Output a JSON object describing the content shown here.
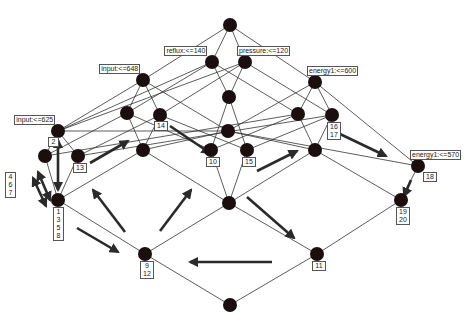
{
  "diagram": {
    "type": "concept-lattice",
    "nodes": [
      {
        "id": "top",
        "x": 230,
        "y": 25
      },
      {
        "id": "reflux",
        "x": 212,
        "y": 62,
        "label": "reflux:<=140"
      },
      {
        "id": "pressure",
        "x": 245,
        "y": 62,
        "label": "pressure:<=120"
      },
      {
        "id": "input648",
        "x": 143,
        "y": 80,
        "label": "input:<=648"
      },
      {
        "id": "energy600",
        "x": 315,
        "y": 82,
        "label": "energy1:<=600"
      },
      {
        "id": "n_a",
        "x": 127,
        "y": 113
      },
      {
        "id": "n_14",
        "x": 160,
        "y": 115,
        "nums": [
          "14"
        ]
      },
      {
        "id": "n_c",
        "x": 229,
        "y": 97
      },
      {
        "id": "n_d",
        "x": 298,
        "y": 114
      },
      {
        "id": "n_1617",
        "x": 332,
        "y": 115,
        "nums": [
          "16",
          "17"
        ]
      },
      {
        "id": "input625",
        "x": 58,
        "y": 131,
        "label": "input:<=625",
        "nums": [
          "2"
        ]
      },
      {
        "id": "n_e",
        "x": 228,
        "y": 131
      },
      {
        "id": "n_f",
        "x": 143,
        "y": 150
      },
      {
        "id": "n_g",
        "x": 315,
        "y": 150
      },
      {
        "id": "n_467",
        "x": 45,
        "y": 156
      },
      {
        "id": "n_13",
        "x": 78,
        "y": 156,
        "nums": [
          "13"
        ]
      },
      {
        "id": "n_10",
        "x": 211,
        "y": 150,
        "nums": [
          "10"
        ]
      },
      {
        "id": "n_15",
        "x": 247,
        "y": 150,
        "nums": [
          "15"
        ]
      },
      {
        "id": "energy570",
        "x": 418,
        "y": 166,
        "label": "energy1:<=570",
        "nums": [
          "18"
        ]
      },
      {
        "id": "n_1358",
        "x": 58,
        "y": 200,
        "nums": [
          "1",
          "3",
          "5",
          "8"
        ]
      },
      {
        "id": "n_h",
        "x": 229,
        "y": 203
      },
      {
        "id": "n_1920",
        "x": 401,
        "y": 200,
        "nums": [
          "19",
          "20"
        ]
      },
      {
        "id": "n_912",
        "x": 145,
        "y": 254,
        "nums": [
          "9",
          "12"
        ]
      },
      {
        "id": "n_11",
        "x": 317,
        "y": 254,
        "nums": [
          "11"
        ]
      },
      {
        "id": "bottom",
        "x": 230,
        "y": 305
      }
    ],
    "side_labels": [
      {
        "nums": [
          "4",
          "6",
          "7"
        ],
        "x": 5,
        "y": 172
      }
    ],
    "edges": [
      [
        "top",
        "reflux"
      ],
      [
        "top",
        "pressure"
      ],
      [
        "top",
        "input648"
      ],
      [
        "top",
        "energy600"
      ],
      [
        "reflux",
        "n_a"
      ],
      [
        "reflux",
        "n_c"
      ],
      [
        "reflux",
        "n_d"
      ],
      [
        "reflux",
        "input625"
      ],
      [
        "pressure",
        "n_14"
      ],
      [
        "pressure",
        "n_c"
      ],
      [
        "pressure",
        "n_1617"
      ],
      [
        "pressure",
        "input625"
      ],
      [
        "input648",
        "n_a"
      ],
      [
        "input648",
        "n_14"
      ],
      [
        "input648",
        "input625"
      ],
      [
        "input648",
        "n_e"
      ],
      [
        "energy600",
        "n_d"
      ],
      [
        "energy600",
        "n_1617"
      ],
      [
        "energy600",
        "energy570"
      ],
      [
        "energy600",
        "n_e"
      ],
      [
        "n_a",
        "n_f"
      ],
      [
        "n_a",
        "n_10"
      ],
      [
        "n_a",
        "n_467"
      ],
      [
        "n_14",
        "n_f"
      ],
      [
        "n_14",
        "n_15"
      ],
      [
        "n_14",
        "n_13"
      ],
      [
        "n_c",
        "n_10"
      ],
      [
        "n_c",
        "n_15"
      ],
      [
        "n_d",
        "n_10"
      ],
      [
        "n_d",
        "n_g"
      ],
      [
        "n_d",
        "n_467"
      ],
      [
        "n_1617",
        "n_15"
      ],
      [
        "n_1617",
        "n_g"
      ],
      [
        "n_1617",
        "n_13"
      ],
      [
        "input625",
        "n_467"
      ],
      [
        "input625",
        "n_13"
      ],
      [
        "input625",
        "n_e"
      ],
      [
        "n_e",
        "n_f"
      ],
      [
        "n_e",
        "n_g"
      ],
      [
        "n_e",
        "energy570"
      ],
      [
        "n_f",
        "n_1358"
      ],
      [
        "n_f",
        "n_h"
      ],
      [
        "n_g",
        "n_h"
      ],
      [
        "n_g",
        "n_1920"
      ],
      [
        "n_467",
        "n_1358"
      ],
      [
        "n_13",
        "n_1358"
      ],
      [
        "n_10",
        "n_h"
      ],
      [
        "n_15",
        "n_h"
      ],
      [
        "energy570",
        "n_1920"
      ],
      [
        "n_1358",
        "n_912"
      ],
      [
        "n_h",
        "n_912"
      ],
      [
        "n_h",
        "n_11"
      ],
      [
        "n_1920",
        "n_11"
      ],
      [
        "n_912",
        "bottom"
      ],
      [
        "n_11",
        "bottom"
      ]
    ],
    "arrows": [
      {
        "x1": 58,
        "y1": 140,
        "x2": 58,
        "y2": 190,
        "double": true
      },
      {
        "x1": 33,
        "y1": 178,
        "x2": 46,
        "y2": 206,
        "double": true
      },
      {
        "x1": 38,
        "y1": 172,
        "x2": 50,
        "y2": 200,
        "double": true
      },
      {
        "x1": 90,
        "y1": 163,
        "x2": 128,
        "y2": 141
      },
      {
        "x1": 170,
        "y1": 126,
        "x2": 210,
        "y2": 153
      },
      {
        "x1": 257,
        "y1": 171,
        "x2": 297,
        "y2": 151
      },
      {
        "x1": 340,
        "y1": 134,
        "x2": 386,
        "y2": 156
      },
      {
        "x1": 411,
        "y1": 180,
        "x2": 404,
        "y2": 196
      },
      {
        "x1": 125,
        "y1": 232,
        "x2": 93,
        "y2": 190
      },
      {
        "x1": 77,
        "y1": 228,
        "x2": 118,
        "y2": 252
      },
      {
        "x1": 160,
        "y1": 231,
        "x2": 191,
        "y2": 190
      },
      {
        "x1": 247,
        "y1": 197,
        "x2": 294,
        "y2": 238
      },
      {
        "x1": 272,
        "y1": 262,
        "x2": 190,
        "y2": 262
      }
    ]
  }
}
